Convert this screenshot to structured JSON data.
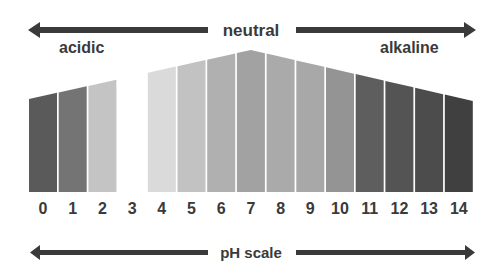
{
  "title": "pH scale",
  "top_label": "neutral",
  "left_label": "acidic",
  "right_label": "alkaline",
  "bottom_label": "pH scale",
  "colors": {
    "text": "#3a3a3a",
    "arrow": "#3a3a3a",
    "background": "#ffffff"
  },
  "bars": [
    {
      "ph": "0",
      "color": "#5a5a5a"
    },
    {
      "ph": "1",
      "color": "#747474"
    },
    {
      "ph": "2",
      "color": "#c4c4c4"
    },
    {
      "ph": "3",
      "color": "#ffffff"
    },
    {
      "ph": "4",
      "color": "#dadada"
    },
    {
      "ph": "5",
      "color": "#c2c2c2"
    },
    {
      "ph": "6",
      "color": "#b0b0b0"
    },
    {
      "ph": "7",
      "color": "#a2a2a2"
    },
    {
      "ph": "8",
      "color": "#aaaaaa"
    },
    {
      "ph": "9",
      "color": "#a8a8a8"
    },
    {
      "ph": "10",
      "color": "#949494"
    },
    {
      "ph": "11",
      "color": "#5e5e5e"
    },
    {
      "ph": "12",
      "color": "#545454"
    },
    {
      "ph": "13",
      "color": "#4c4c4c"
    },
    {
      "ph": "14",
      "color": "#404040"
    }
  ]
}
